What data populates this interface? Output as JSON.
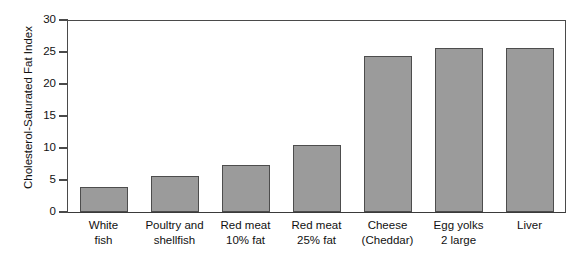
{
  "chart_data": {
    "type": "bar",
    "title": "",
    "xlabel": "",
    "ylabel": "Cholesterol-Saturated Fat Index",
    "ylim": [
      0,
      30
    ],
    "yticks": [
      0,
      5,
      10,
      15,
      20,
      25,
      30
    ],
    "grid": false,
    "legend": "none",
    "bar_color": "#9b9b9b",
    "bar_border_color": "#4d4d4d",
    "axis_color": "#4a4a4a",
    "categories": [
      "White fish",
      "Poultry and shellfish",
      "Red meat 10% fat",
      "Red meat 25% fat",
      "Cheese (Cheddar)",
      "Egg yolks 2 large",
      "Liver"
    ],
    "category_lines": [
      [
        "White",
        "fish"
      ],
      [
        "Poultry and",
        "shellfish"
      ],
      [
        "Red meat",
        "10% fat"
      ],
      [
        "Red meat",
        "25% fat"
      ],
      [
        "Cheese",
        "(Cheddar)"
      ],
      [
        "Egg yolks",
        "2 large"
      ],
      [
        "Liver",
        ""
      ]
    ],
    "values": [
      3.9,
      5.6,
      7.3,
      10.5,
      24.3,
      25.6,
      25.7
    ]
  }
}
